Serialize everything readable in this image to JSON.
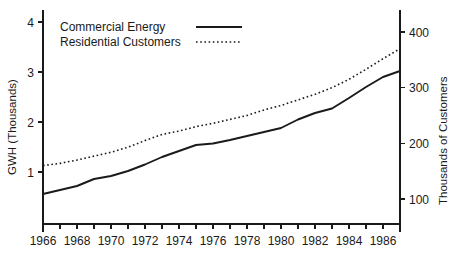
{
  "chart_data": {
    "type": "line",
    "title": "",
    "xlabel": "",
    "ylabel": "GWH (Thousands)",
    "y2label": "Thousands of Customers",
    "grid": false,
    "legend_position": "top-left",
    "x": [
      1966,
      1967,
      1968,
      1969,
      1970,
      1971,
      1972,
      1973,
      1974,
      1975,
      1976,
      1977,
      1978,
      1979,
      1980,
      1981,
      1982,
      1983,
      1984,
      1985,
      1986,
      1987
    ],
    "xlim": [
      1966,
      1987
    ],
    "xticks_major": [
      1966,
      1968,
      1970,
      1972,
      1974,
      1976,
      1978,
      1980,
      1982,
      1984,
      1986
    ],
    "xtick_labels": [
      "1966",
      "1968",
      "1970",
      "1972",
      "1974",
      "1976",
      "1978",
      "1980",
      "1982",
      "1984",
      "1986"
    ],
    "ylim": [
      0.2,
      4.0
    ],
    "yticks": [
      1,
      2,
      3,
      4
    ],
    "ytick_labels": [
      "1",
      "2",
      "3",
      "4"
    ],
    "y2lim": [
      75,
      400
    ],
    "y2ticks": [
      100,
      200,
      300,
      400
    ],
    "y2tick_labels": [
      "100",
      "200",
      "300",
      "400"
    ],
    "series": [
      {
        "name": "Commercial Energy",
        "axis": "left",
        "style": "solid",
        "color": "#1a1a1a",
        "units": "GWH (Thousands)",
        "values": [
          0.56,
          0.64,
          0.72,
          0.86,
          0.92,
          1.02,
          1.15,
          1.3,
          1.42,
          1.54,
          1.57,
          1.64,
          1.72,
          1.8,
          1.88,
          2.05,
          2.18,
          2.27,
          2.48,
          2.7,
          2.9,
          3.02
        ]
      },
      {
        "name": "Residential Customers",
        "axis": "right",
        "style": "dotted",
        "color": "#1a1a1a",
        "units": "Thousands of Customers",
        "values": [
          160,
          164,
          170,
          177,
          184,
          193,
          205,
          216,
          222,
          230,
          236,
          243,
          250,
          260,
          268,
          278,
          288,
          300,
          315,
          333,
          352,
          370
        ]
      }
    ],
    "legend": [
      {
        "label": "Commercial Energy",
        "style": "solid"
      },
      {
        "label": "Residential Customers",
        "style": "dotted"
      }
    ]
  }
}
